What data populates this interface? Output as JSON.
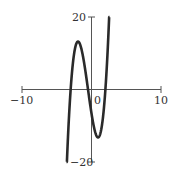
{
  "chart_data": {
    "type": "line",
    "title": "",
    "xlabel": "",
    "ylabel": "",
    "xlim": [
      -10,
      10
    ],
    "ylim": [
      -20,
      20
    ],
    "x_tick_labels": [
      "-10",
      "0",
      "10"
    ],
    "y_tick_labels": [
      "20",
      "-20"
    ],
    "grid": false,
    "legend": null,
    "series": [
      {
        "name": "cubic",
        "description": "approx f(x) = 2.2(x+3)(x+0.5)(x-2)",
        "x": [
          -3.6,
          -3.0,
          -2.5,
          -2.1,
          -1.5,
          -1.0,
          -0.5,
          0.0,
          0.5,
          0.95,
          1.5,
          2.0,
          2.4,
          2.6
        ],
        "y": [
          -20,
          0,
          10,
          12.7,
          11.6,
          6.6,
          0,
          -6.6,
          -11.6,
          -13.8,
          -10.2,
          0,
          10.9,
          20
        ]
      }
    ],
    "local_max": {
      "x": -2.1,
      "y": 12.7
    },
    "local_min": {
      "x": 0.95,
      "y": -13.8
    },
    "roots": [
      -3.0,
      -0.5,
      2.0
    ]
  },
  "labels": {
    "x_min": "−10",
    "x_zero": "0",
    "x_max": "10",
    "y_max": "20",
    "y_min": "−20"
  }
}
